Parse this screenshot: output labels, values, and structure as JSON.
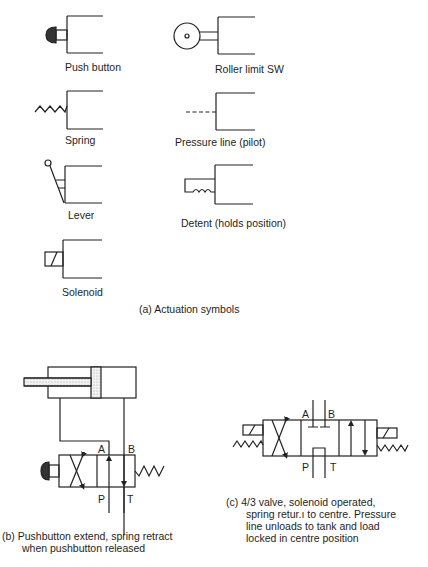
{
  "part_a": {
    "caption": "(a)  Actuation symbols",
    "symbols": [
      {
        "id": "push-button",
        "label": "Push button"
      },
      {
        "id": "roller-limit",
        "label": "Roller limit SW"
      },
      {
        "id": "spring",
        "label": "Spring"
      },
      {
        "id": "pressure-line",
        "label": "Pressure line (pilot)"
      },
      {
        "id": "lever",
        "label": "Lever"
      },
      {
        "id": "detent",
        "label": "Detent (holds position)"
      },
      {
        "id": "solenoid",
        "label": "Solenoid"
      }
    ]
  },
  "part_b": {
    "ports": {
      "A": "A",
      "B": "B",
      "P": "P",
      "T": "T"
    },
    "caption_line1": "(b)  Pushbutton extend, spring retract",
    "caption_line2": "when pushbutton released"
  },
  "part_c": {
    "ports": {
      "A": "A",
      "B": "B",
      "P": "P",
      "T": "T"
    },
    "caption_line1": "(c)  4/3 valve, solenoid operated,",
    "caption_line2": "spring retur.ı to centre.  Pressure",
    "caption_line3": "line unloads to tank and load",
    "caption_line4": "locked in centre position"
  }
}
